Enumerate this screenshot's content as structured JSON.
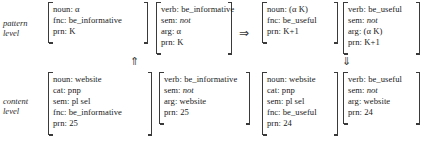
{
  "diagram": {
    "levels": [
      {
        "id": "pattern",
        "line1": "pattern",
        "line2": "level"
      },
      {
        "id": "content",
        "line1": "content",
        "line2": "level"
      }
    ],
    "arrows": {
      "derive": "⇒",
      "up": "⇑",
      "down": "⇓"
    },
    "pattern_level": {
      "matrices": [
        {
          "id": "pattern-noun-source",
          "features": [
            {
              "attr": "noun:",
              "val": "α",
              "italic": false
            },
            {
              "attr": "fnc:",
              "val": "be_informative",
              "italic": false
            },
            {
              "attr": "prn:",
              "val": "K",
              "italic": false
            }
          ]
        },
        {
          "id": "pattern-verb-source",
          "features": [
            {
              "attr": "verb:",
              "val": "be_informative",
              "italic": false
            },
            {
              "attr": "sem:",
              "val": "not",
              "italic": true
            },
            {
              "attr": "arg:",
              "val": "α",
              "italic": false
            },
            {
              "attr": "prn:",
              "val": "K",
              "italic": false
            }
          ]
        },
        {
          "id": "pattern-noun-target",
          "features": [
            {
              "attr": "noun:",
              "val": "(α K)",
              "italic": false
            },
            {
              "attr": "fnc:",
              "val": "be_useful",
              "italic": false
            },
            {
              "attr": "prn:",
              "val": "K+1",
              "italic": false
            }
          ]
        },
        {
          "id": "pattern-verb-target",
          "features": [
            {
              "attr": "verb:",
              "val": "be_useful",
              "italic": false
            },
            {
              "attr": "sem:",
              "val": "not",
              "italic": true
            },
            {
              "attr": "arg:",
              "val": "(α K)",
              "italic": false
            },
            {
              "attr": "prn:",
              "val": "K+1",
              "italic": false
            }
          ]
        }
      ]
    },
    "content_level": {
      "matrices": [
        {
          "id": "content-noun-source",
          "features": [
            {
              "attr": "noun:",
              "val": "website",
              "italic": false
            },
            {
              "attr": "cat:",
              "val": "pnp",
              "italic": false
            },
            {
              "attr": "sem:",
              "val": "pl sel",
              "italic": false
            },
            {
              "attr": "fnc:",
              "val": "be_informative",
              "italic": false
            },
            {
              "attr": "prn:",
              "val": "25",
              "italic": false
            }
          ]
        },
        {
          "id": "content-verb-source",
          "features": [
            {
              "attr": "verb:",
              "val": "be_informative",
              "italic": false
            },
            {
              "attr": "sem:",
              "val": "not",
              "italic": true
            },
            {
              "attr": "arg:",
              "val": "website",
              "italic": false
            },
            {
              "attr": "prn:",
              "val": "25",
              "italic": false
            }
          ]
        },
        {
          "id": "content-noun-target",
          "features": [
            {
              "attr": "noun:",
              "val": "website",
              "italic": false
            },
            {
              "attr": "cat:",
              "val": "pnp",
              "italic": false
            },
            {
              "attr": "sem:",
              "val": "pl sel",
              "italic": false
            },
            {
              "attr": "fnc:",
              "val": "be_useful",
              "italic": false
            },
            {
              "attr": "prn:",
              "val": "24",
              "italic": false
            }
          ]
        },
        {
          "id": "content-verb-target",
          "features": [
            {
              "attr": "verb:",
              "val": "be_useful",
              "italic": false
            },
            {
              "attr": "sem:",
              "val": "not",
              "italic": true
            },
            {
              "attr": "arg:",
              "val": "website",
              "italic": false
            },
            {
              "attr": "prn:",
              "val": "24",
              "italic": false
            }
          ]
        }
      ]
    }
  },
  "colors": {
    "background": "#ffffff",
    "ink": "#1a1a1a",
    "rule": "#3a3a3a"
  }
}
